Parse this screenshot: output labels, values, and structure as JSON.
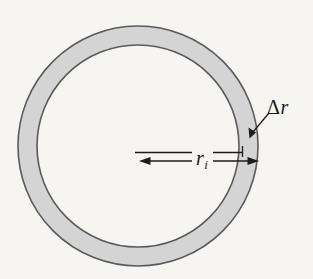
{
  "figure": {
    "canvas": {
      "width": 313,
      "height": 279
    },
    "colors": {
      "background": "#f6f5f2",
      "ring_fill": "#d4d4d4",
      "ring_stroke": "#5a5a5a",
      "line": "#1d1d1d",
      "text": "#16171a"
    },
    "geometry": {
      "center_x": 138,
      "center_y": 146,
      "outer_radius": 120,
      "inner_radius": 101
    },
    "labels": {
      "delta_r": {
        "delta": "Δ",
        "variable": "r",
        "full": "Δr"
      },
      "inner_radius": {
        "variable": "r",
        "subscript": "i",
        "full": "rᵢ"
      }
    },
    "annotations": {
      "radius_dimension_from_x": 140,
      "radius_dimension_to_x": 258,
      "radius_dimension_y": 161,
      "extension_line_y": 152,
      "extension_line_from_x": 135,
      "extension_line_to_x": 243,
      "leader_from": [
        268,
        114
      ],
      "leader_to": [
        250,
        137
      ]
    }
  }
}
